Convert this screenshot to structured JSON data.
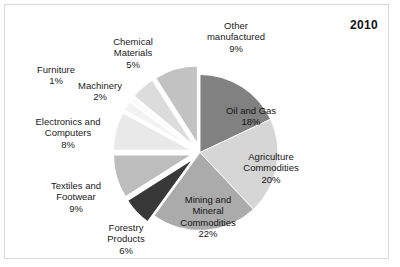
{
  "year_label": "2010",
  "frame": {
    "border_color": "#d9d9d9",
    "background": "#ffffff"
  },
  "chart_data": {
    "type": "pie",
    "title": "2010",
    "categories": [
      "Oil and Gas",
      "Agriculture Commodities",
      "Mining and Mineral Commodities",
      "Forestry Products",
      "Textiles and Footwear",
      "Electronics and Computers",
      "Machinery",
      "Furniture",
      "Chemical Materials",
      "Other manufactured"
    ],
    "values": [
      18,
      20,
      22,
      6,
      9,
      8,
      2,
      1,
      5,
      9
    ],
    "unit": "%",
    "legend": "none",
    "grid": false,
    "start_angle_deg": 0,
    "direction": "clockwise",
    "slices": [
      {
        "name": "Oil and Gas",
        "label": "Oil and Gas",
        "pct_label": "18%",
        "value": 18,
        "color": "#818181",
        "exploded": false,
        "label_position": "inside"
      },
      {
        "name": "Agriculture Commodities",
        "label": "Agriculture\nCommodities",
        "pct_label": "20%",
        "value": 20,
        "color": "#d6d6d6",
        "exploded": false,
        "label_position": "inside"
      },
      {
        "name": "Mining and Mineral Commodities",
        "label": "Mining and\nMineral\nCommodities",
        "pct_label": "22%",
        "value": 22,
        "color": "#ababab",
        "exploded": false,
        "label_position": "inside"
      },
      {
        "name": "Forestry Products",
        "label": "Forestry\nProducts",
        "pct_label": "6%",
        "value": 6,
        "color": "#383838",
        "exploded": true,
        "label_position": "outside"
      },
      {
        "name": "Textiles and Footwear",
        "label": "Textiles and\nFootwear",
        "pct_label": "9%",
        "value": 9,
        "color": "#bdbdbd",
        "exploded": true,
        "label_position": "outside"
      },
      {
        "name": "Electronics and Computers",
        "label": "Electronics and\nComputers",
        "pct_label": "8%",
        "value": 8,
        "color": "#e9e9e9",
        "exploded": true,
        "label_position": "outside"
      },
      {
        "name": "Machinery",
        "label": "Machinery",
        "pct_label": "2%",
        "value": 2,
        "color": "#f3f3f3",
        "exploded": true,
        "label_position": "outside"
      },
      {
        "name": "Furniture",
        "label": "Furniture",
        "pct_label": "1%",
        "value": 1,
        "color": "#fafafa",
        "exploded": true,
        "label_position": "outside"
      },
      {
        "name": "Chemical Materials",
        "label": "Chemical\nMaterials",
        "pct_label": "5%",
        "value": 5,
        "color": "#dcdcdc",
        "exploded": true,
        "label_position": "outside"
      },
      {
        "name": "Other manufactured",
        "label": "Other\nmanufactured",
        "pct_label": "9%",
        "value": 9,
        "color": "#c2c2c2",
        "exploded": true,
        "label_position": "outside"
      }
    ]
  },
  "labels": {
    "other_manufactured": {
      "text": "Other\nmanufactured",
      "pct": "9%"
    },
    "chemical_materials": {
      "text": "Chemical\nMaterials",
      "pct": "5%"
    },
    "furniture": {
      "text": "Furniture",
      "pct": "1%"
    },
    "machinery": {
      "text": "Machinery",
      "pct": "2%"
    },
    "electronics_computers": {
      "text": "Electronics and\nComputers",
      "pct": "8%"
    },
    "textiles_footwear": {
      "text": "Textiles and\nFootwear",
      "pct": "9%"
    },
    "forestry_products": {
      "text": "Forestry\nProducts",
      "pct": "6%"
    },
    "oil_and_gas": {
      "text": "Oil and Gas",
      "pct": "18%"
    },
    "agriculture_commodities": {
      "text": "Agriculture\nCommodities",
      "pct": "20%"
    },
    "mining_mineral": {
      "text": "Mining and\nMineral\nCommodities",
      "pct": "22%"
    }
  }
}
